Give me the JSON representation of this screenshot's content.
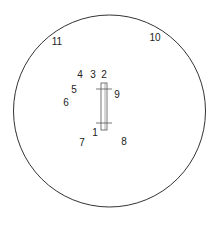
{
  "diagram": {
    "type": "circular-field-diagram",
    "stroke_color": "#333333",
    "text_color": "#222222",
    "background": "#ffffff",
    "circle": {
      "cx": 109.5,
      "cy": 111,
      "r": 96
    },
    "center_bar": {
      "x": 101,
      "y": 83,
      "width": 6,
      "height": 47,
      "ticks": [
        {
          "y": 89,
          "x1": 96,
          "x2": 112
        },
        {
          "y": 123,
          "x1": 96,
          "x2": 112
        }
      ]
    },
    "labels": [
      {
        "id": "1",
        "text": "1",
        "x": 95,
        "y": 133
      },
      {
        "id": "2",
        "text": "2",
        "x": 104,
        "y": 75
      },
      {
        "id": "3",
        "text": "3",
        "x": 93,
        "y": 75
      },
      {
        "id": "4",
        "text": "4",
        "x": 80,
        "y": 75
      },
      {
        "id": "5",
        "text": "5",
        "x": 74,
        "y": 90
      },
      {
        "id": "6",
        "text": "6",
        "x": 66,
        "y": 103
      },
      {
        "id": "7",
        "text": "7",
        "x": 82,
        "y": 143
      },
      {
        "id": "8",
        "text": "8",
        "x": 124,
        "y": 142
      },
      {
        "id": "9",
        "text": "9",
        "x": 117,
        "y": 95
      },
      {
        "id": "10",
        "text": "10",
        "x": 155,
        "y": 38
      },
      {
        "id": "11",
        "text": "11",
        "x": 57,
        "y": 42
      }
    ]
  }
}
